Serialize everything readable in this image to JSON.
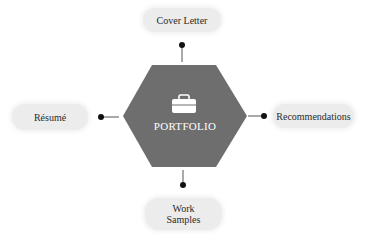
{
  "diagram": {
    "center": {
      "label": "PORTFOLIO",
      "icon": "briefcase-icon",
      "shape": "hexagon",
      "fill_color": "#6e6e6e"
    },
    "nodes": [
      {
        "position": "top",
        "label": "Cover Letter"
      },
      {
        "position": "left",
        "label": "Résumé"
      },
      {
        "position": "right",
        "label": "Recommendations"
      },
      {
        "position": "bottom",
        "label_line1": "Work",
        "label_line2": "Samples"
      }
    ],
    "colors": {
      "pill_background": "#ececec",
      "connector": "#333333",
      "text": "#2b2b2b",
      "center_text": "#ffffff"
    }
  }
}
